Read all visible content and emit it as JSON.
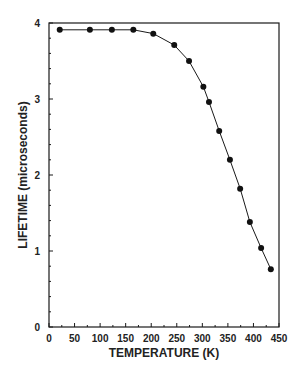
{
  "chart_data": {
    "type": "line",
    "title": "",
    "xlabel": "TEMPERATURE (K)",
    "ylabel": "LIFETIME (microseconds)",
    "xlim": [
      0,
      450
    ],
    "ylim": [
      0,
      4
    ],
    "xticks": [
      0,
      50,
      100,
      150,
      200,
      250,
      300,
      350,
      400,
      450
    ],
    "yticks": [
      0,
      1,
      2,
      3,
      4
    ],
    "grid": false,
    "legend": null,
    "series": [
      {
        "name": "lifetime",
        "marker": "filled-circle",
        "x": [
          21,
          80,
          123,
          165,
          204,
          245,
          274,
          302,
          313,
          333,
          354,
          374,
          393,
          415,
          434
        ],
        "y": [
          3.91,
          3.91,
          3.91,
          3.91,
          3.86,
          3.71,
          3.5,
          3.16,
          2.96,
          2.58,
          2.2,
          1.82,
          1.38,
          1.04,
          0.76
        ]
      }
    ]
  },
  "colors": {
    "ink": "#1a1a1a",
    "background": "#ffffff"
  }
}
